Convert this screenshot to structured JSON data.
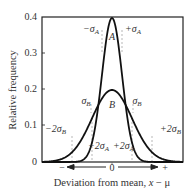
{
  "chart_data": {
    "type": "line",
    "title": "",
    "xlabel": "Deviation from mean, x − μ",
    "ylabel": "Relative frequency",
    "ylim": [
      0,
      0.4
    ],
    "yticks": [
      "0",
      "0.1",
      "0.2",
      "0.3",
      "0.4"
    ],
    "xticks": [
      "−",
      "0",
      "+"
    ],
    "grid": false,
    "legend": null,
    "series": [
      {
        "name": "A",
        "distribution": "normal",
        "mean": 0,
        "sigma": 1,
        "peak": 0.4
      },
      {
        "name": "B",
        "distribution": "normal",
        "mean": 0,
        "sigma": 2,
        "peak": 0.2
      }
    ],
    "annotations": [
      {
        "text": "−σA",
        "x_sigma_A": -1,
        "series": "A"
      },
      {
        "text": "+σA",
        "x_sigma_A": 1,
        "series": "A"
      },
      {
        "text": "σB",
        "x_sigma_B": -1,
        "series": "B"
      },
      {
        "text": "σB",
        "x_sigma_B": 1,
        "series": "B"
      },
      {
        "text": "−2σA",
        "x_sigma_A": -2,
        "series": "A"
      },
      {
        "text": "+2σA",
        "x_sigma_A": 2,
        "series": "A"
      },
      {
        "text": "−2σB",
        "x_sigma_B": -2,
        "series": "B"
      },
      {
        "text": "+2σB",
        "x_sigma_B": 2,
        "series": "B"
      }
    ]
  },
  "axes": {
    "ylabel": "Relative frequency",
    "xlabel_main": "Deviation from mean, ",
    "xlabel_var": "x",
    "xlabel_rest": " − μ",
    "yticks": [
      "0.4",
      "0.3",
      "0.2",
      "0.1",
      "0"
    ],
    "x_minus": "−",
    "x_zero": "0",
    "x_plus": "+"
  },
  "labels": {
    "curve_a": "A",
    "curve_b": "B",
    "minus_sigma_a": {
      "pre": "−σ",
      "sub": "A"
    },
    "plus_sigma_a": {
      "pre": "+σ",
      "sub": "A"
    },
    "minus_sigma_b": {
      "pre": "σ",
      "sub": "B"
    },
    "plus_sigma_b": {
      "pre": "σ",
      "sub": "B"
    },
    "minus_2sigma_a": {
      "pre": "−2σ",
      "sub": "A"
    },
    "plus_2sigma_a": {
      "pre": "+2σ",
      "sub": "A"
    },
    "minus_2sigma_b": {
      "pre": "−2σ",
      "sub": "B"
    },
    "plus_2sigma_b": {
      "pre": "+2σ",
      "sub": "B"
    }
  }
}
